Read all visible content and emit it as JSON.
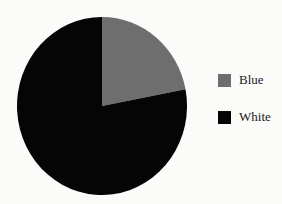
{
  "chart_data": {
    "type": "pie",
    "title": "",
    "categories": [
      "Blue",
      "White"
    ],
    "values": [
      22,
      78
    ],
    "unit": "%",
    "colors": [
      "#6e6e6e",
      "#050505"
    ],
    "start_angle": "12 o'clock",
    "direction": "clockwise",
    "legend": {
      "position": "right",
      "entries": [
        {
          "label": "Blue",
          "color": "#6e6e6e"
        },
        {
          "label": "White",
          "color": "#050505"
        }
      ]
    }
  },
  "legend": {
    "items": [
      {
        "label": "Blue",
        "color": "#6e6e6e"
      },
      {
        "label": "White",
        "color": "#050505"
      }
    ]
  }
}
